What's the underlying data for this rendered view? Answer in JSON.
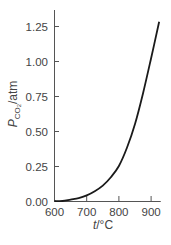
{
  "chart_data": {
    "type": "line",
    "title": "",
    "xlabel": "t/°C",
    "ylabel": "P_CO2/atm",
    "xlim": [
      600,
      930
    ],
    "ylim": [
      0,
      1.35
    ],
    "xticks": [
      600,
      700,
      800,
      900
    ],
    "xtick_labels": [
      "600",
      "700",
      "800",
      "900"
    ],
    "yticks": [
      0.0,
      0.25,
      0.5,
      0.75,
      1.0,
      1.25
    ],
    "ytick_labels": [
      "0.00",
      "0.25",
      "0.50",
      "0.75",
      "1.00",
      "1.25"
    ],
    "grid": false,
    "legend": null,
    "series": [
      {
        "name": "P_CO2 vs t",
        "x": [
          600,
          625,
          650,
          675,
          700,
          725,
          750,
          775,
          800,
          825,
          850,
          875,
          900,
          925
        ],
        "values": [
          0.0,
          0.0,
          0.01,
          0.02,
          0.04,
          0.07,
          0.11,
          0.17,
          0.25,
          0.38,
          0.55,
          0.77,
          1.02,
          1.28
        ]
      }
    ]
  },
  "labels": {
    "xlabel_italic": "t",
    "xlabel_rest": "/°C",
    "ylabel_italic": "P",
    "ylabel_sub": "CO",
    "ylabel_subsub": "2",
    "ylabel_rest": "/atm"
  }
}
